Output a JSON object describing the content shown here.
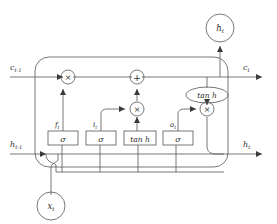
{
  "diagram": {
    "type": "lstm-cell-schematic",
    "background_color": "#ffffff",
    "line_color": "#555555",
    "text_color": "#2b2b2b"
  },
  "inputs": {
    "cell_state_prev": "c",
    "cell_state_prev_sub": "t-1",
    "hidden_prev": "h",
    "hidden_prev_sub": "t-1",
    "input_x": "x",
    "input_x_sub": "t"
  },
  "outputs": {
    "cell_state": "c",
    "cell_state_sub": "t",
    "hidden": "h",
    "hidden_sub": "t",
    "hidden_top": "h",
    "hidden_top_sub": "t"
  },
  "gates": [
    {
      "name": "forget-gate",
      "label": "f",
      "sub": "t",
      "box_text": "σ"
    },
    {
      "name": "input-gate",
      "label": "i",
      "sub": "t",
      "box_text": "σ"
    },
    {
      "name": "candidate-gate",
      "label": "",
      "sub": "",
      "box_text": "tan h"
    },
    {
      "name": "output-gate",
      "label": "o",
      "sub": "t",
      "box_text": "σ"
    }
  ],
  "operators": [
    {
      "name": "multiply-forget",
      "symbol": "×"
    },
    {
      "name": "add-cell-state",
      "symbol": "+"
    },
    {
      "name": "multiply-input",
      "symbol": "×"
    },
    {
      "name": "multiply-output",
      "symbol": "×"
    }
  ],
  "activation": {
    "name": "tanh-activation",
    "text": "tan h"
  }
}
